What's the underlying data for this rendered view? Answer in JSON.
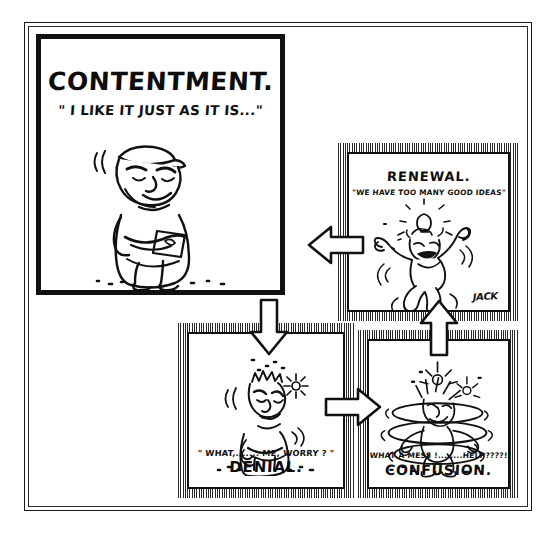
{
  "document": {
    "kind": "four-panel cartoon cycle diagram",
    "signature": "JACK"
  },
  "panels": [
    {
      "id": "contentment",
      "title": "CONTENTMENT.",
      "quote": "\" I  LIKE IT JUST AS IT IS...\"",
      "art": "cartoon-man-arms-folded-smiling",
      "border_style": "solid-heavy-black"
    },
    {
      "id": "renewal",
      "title": "RENEWAL.",
      "quote": "\"WE HAVE TOO MANY GOOD IDEAS\"",
      "art": "cartoon-man-jumping-with-lightbulb",
      "border_style": "hatched",
      "signature": "JACK"
    },
    {
      "id": "denial",
      "title": "DENIAL.",
      "quote": "\" WHAT,....... ME, WORRY ? \"",
      "art": "cartoon-man-arms-folded-eyes-shut",
      "border_style": "hatched"
    },
    {
      "id": "confusion",
      "title": "CONFUSION.",
      "quote": "WHAT A MESS !........HELP????!",
      "art": "cartoon-man-spinning-in-whirl",
      "border_style": "hatched"
    }
  ],
  "arrows": [
    {
      "id": "renewal-to-contentment",
      "direction": "left",
      "from": "renewal",
      "to": "contentment"
    },
    {
      "id": "contentment-to-denial",
      "direction": "down",
      "from": "contentment",
      "to": "denial"
    },
    {
      "id": "denial-to-confusion",
      "direction": "right",
      "from": "denial",
      "to": "confusion"
    },
    {
      "id": "confusion-to-renewal",
      "direction": "up",
      "from": "confusion",
      "to": "renewal"
    }
  ],
  "colors": {
    "ink": "#111111",
    "paper": "#ffffff",
    "frame": "#1a1a1a"
  }
}
